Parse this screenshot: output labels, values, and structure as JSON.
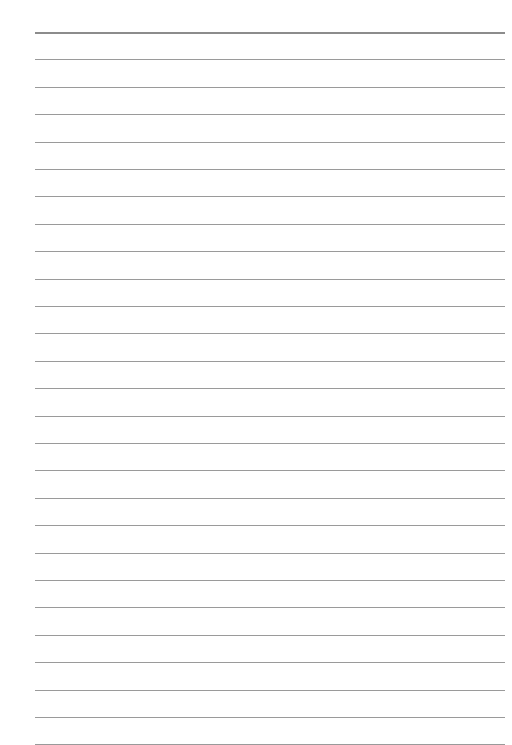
{
  "page": {
    "type": "lined-paper",
    "background": "#ffffff",
    "rule_color": "#9a9a9a",
    "top_rule_color": "#8c8c8c",
    "rule_left": 35,
    "rule_right": 505,
    "first_rule_y": 32,
    "rule_spacing": 27.4,
    "rule_count": 27
  }
}
